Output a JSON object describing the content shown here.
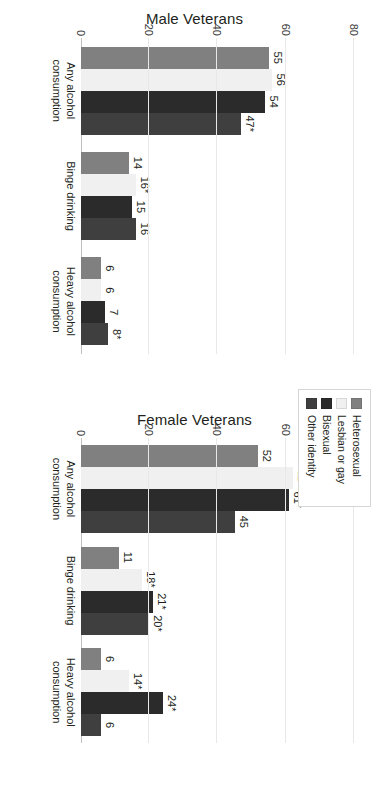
{
  "chart_data": {
    "type": "bar",
    "title": "",
    "xlabel": "",
    "ylabel": "",
    "ylim": [
      0,
      85
    ],
    "yticks": [
      0,
      20,
      40,
      60,
      80
    ],
    "grid": true,
    "legend_position": "center-right",
    "orientation": "rotated-90",
    "categories": [
      "Any alcohol consumption",
      "Binge drinking",
      "Heavy alcohol consumption"
    ],
    "panels": [
      {
        "name": "Male Veterans",
        "series": [
          {
            "name": "Heterosexual",
            "values": [
              55,
              14,
              6
            ],
            "labels": [
              "55",
              "14",
              "6"
            ]
          },
          {
            "name": "Lesbian or gay",
            "values": [
              56,
              16,
              6
            ],
            "labels": [
              "56",
              "16*",
              "6"
            ]
          },
          {
            "name": "Bisexual",
            "values": [
              54,
              15,
              7
            ],
            "labels": [
              "54",
              "15",
              "7"
            ]
          },
          {
            "name": "Other identity",
            "values": [
              47,
              16,
              8
            ],
            "labels": [
              "47*",
              "16",
              "8*"
            ]
          }
        ]
      },
      {
        "name": "Female Veterans",
        "series": [
          {
            "name": "Heterosexual",
            "values": [
              52,
              11,
              6
            ],
            "labels": [
              "52",
              "11",
              "6"
            ]
          },
          {
            "name": "Lesbian or gay",
            "values": [
              62,
              18,
              14
            ],
            "labels": [
              "62*",
              "18*",
              "14*"
            ]
          },
          {
            "name": "Bisexual",
            "values": [
              61,
              21,
              24
            ],
            "labels": [
              "61*",
              "21*",
              "24*"
            ]
          },
          {
            "name": "Other identity",
            "values": [
              45,
              20,
              6
            ],
            "labels": [
              "45",
              "20*",
              "6"
            ]
          }
        ]
      }
    ],
    "legend": [
      {
        "label": "Heterosexual",
        "color": "#808080"
      },
      {
        "label": "Lesbian or gay",
        "color": "#f0f0f0"
      },
      {
        "label": "Bisexual",
        "color": "#2b2b2b"
      },
      {
        "label": "Other identity",
        "color": "#3f3f3f"
      }
    ],
    "colors": {
      "heterosexual": "#808080",
      "lesbian_or_gay": "#f0f0f0",
      "bisexual": "#2b2b2b",
      "other_identity": "#3f3f3f",
      "gridline": "#e8e8e8",
      "axis": "#bfbfbf",
      "text": "#231f20",
      "background": "#ffffff"
    }
  }
}
